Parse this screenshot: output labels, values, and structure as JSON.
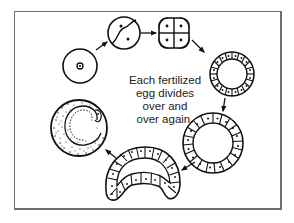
{
  "diagram": {
    "type": "cell-division-cycle",
    "caption_lines": [
      "Each fertilized",
      "egg divides",
      "over and",
      "over again."
    ],
    "stages": [
      {
        "id": "single-cell",
        "label": "fertilized egg (1 cell)"
      },
      {
        "id": "two-cell",
        "label": "2-cell stage"
      },
      {
        "id": "four-cell",
        "label": "4-cell stage"
      },
      {
        "id": "small-blastula",
        "label": "hollow ball of cells"
      },
      {
        "id": "large-blastula",
        "label": "larger hollow ball of cells"
      },
      {
        "id": "gastrula",
        "label": "folded cup of cells"
      },
      {
        "id": "embryo",
        "label": "developing embryo"
      }
    ],
    "colors": {
      "ink": "#111111",
      "frame": "#6f6f6f",
      "background": "#ffffff"
    }
  }
}
